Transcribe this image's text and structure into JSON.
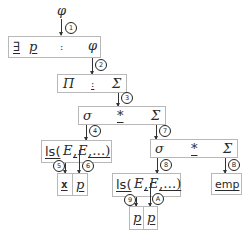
{
  "diagram": {
    "root": {
      "symbol": "φ"
    },
    "box_exists": {
      "quantifier": "∃",
      "var": "p",
      "colon": ":",
      "body": "φ"
    },
    "box_pure": {
      "pi": "Π",
      "colon": ":",
      "sigma": "Σ"
    },
    "box_star1": {
      "sigma": "σ",
      "star": "*",
      "Sigma": "Σ"
    },
    "box_ls1": {
      "pred": "ls(",
      "arg1": "E",
      "comma1": ",",
      "arg2": "E",
      "rest": ",…)"
    },
    "cells_1": {
      "left": "x",
      "right": "p"
    },
    "box_star2": {
      "sigma": "σ",
      "star": "*",
      "Sigma": "Σ"
    },
    "box_ls2": {
      "pred": "ls(",
      "arg1": "E",
      "comma1": ",",
      "arg2": "E",
      "rest": ",…)"
    },
    "cells_2": {
      "left": "p",
      "right": "p"
    },
    "box_emp": {
      "label": "emp"
    },
    "badges": [
      "1",
      "2",
      "3",
      "4",
      "5",
      "6",
      "7",
      "8",
      "9",
      "A",
      "B"
    ]
  }
}
